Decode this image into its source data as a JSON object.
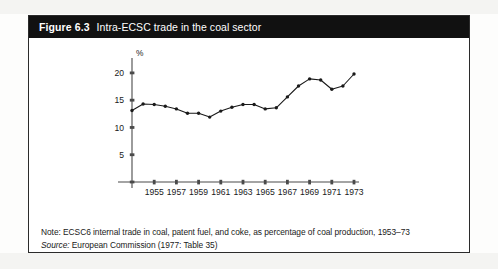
{
  "figure": {
    "number": "Figure 6.3",
    "title": "Intra-ECSC trade in the coal sector"
  },
  "notes": {
    "note_label": "Note:",
    "note_text": "ECSC6 internal trade in coal, patent fuel, and coke, as percentage of coal production, 1953–73",
    "source_label": "Source:",
    "source_text": "European Commission (1977: Table 35)"
  },
  "colors": {
    "header_bg": "#111111",
    "header_text": "#ffffff",
    "panel_bg": "#ffffff",
    "border": "#2b2b2b",
    "line": "#1a1a1a",
    "marker": "#1a1a1a",
    "axis": "#4a4a4a"
  },
  "chart_data": {
    "type": "line",
    "title": "Intra-ECSC trade in the coal sector",
    "subtitle": "",
    "xlabel": "",
    "ylabel": "%",
    "ylim": [
      0,
      22
    ],
    "xlim": [
      1953,
      1973
    ],
    "grid": false,
    "legend": "none",
    "yticks": [
      5,
      10,
      15,
      20
    ],
    "ytick_labels": [
      "5",
      "10",
      "15",
      "20"
    ],
    "xticks": [
      1955,
      1957,
      1959,
      1961,
      1963,
      1965,
      1967,
      1969,
      1971,
      1973
    ],
    "xtick_labels": [
      "1955",
      "1957",
      "1959",
      "1961",
      "1963",
      "1965",
      "1967",
      "1969",
      "1971",
      "1973"
    ],
    "x": [
      1953,
      1954,
      1955,
      1956,
      1957,
      1958,
      1959,
      1960,
      1961,
      1962,
      1963,
      1964,
      1965,
      1966,
      1967,
      1968,
      1969,
      1970,
      1971,
      1972,
      1973
    ],
    "values": [
      13.1,
      14.3,
      14.2,
      13.9,
      13.4,
      12.6,
      12.6,
      11.9,
      13.0,
      13.7,
      14.2,
      14.2,
      13.4,
      13.6,
      15.6,
      17.6,
      18.9,
      18.7,
      17.0,
      17.6,
      19.8
    ],
    "series": [
      {
        "name": "Intra-ECSC coal trade (% of coal production)",
        "values": [
          13.1,
          14.3,
          14.2,
          13.9,
          13.4,
          12.6,
          12.6,
          11.9,
          13.0,
          13.7,
          14.2,
          14.2,
          13.4,
          13.6,
          15.6,
          17.6,
          18.9,
          18.7,
          17.0,
          17.6,
          19.8
        ]
      }
    ]
  }
}
